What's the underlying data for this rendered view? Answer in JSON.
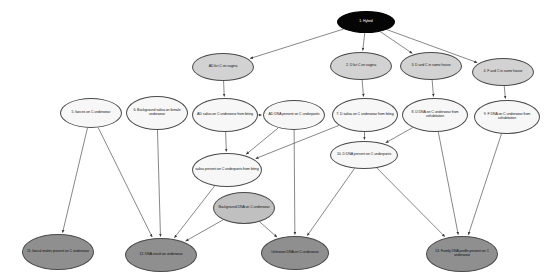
{
  "diagram": {
    "background_color": "#ffffff",
    "edge_color": "#555555",
    "nodes": [
      {
        "id": "n1",
        "label": "1. Hybrid",
        "x": 337,
        "y": 11,
        "w": 58,
        "h": 22,
        "fill": "#050505",
        "text_color": "#ffffff",
        "style": "fill-black",
        "font_size": 3.6
      },
      {
        "id": "n2",
        "label": "2. D lict C on vagina",
        "x": 330,
        "y": 52,
        "w": 62,
        "h": 28,
        "fill": "#d2d2d2",
        "text_color": "#1a1a1a",
        "style": "fill-light",
        "font_size": 3.6
      },
      {
        "id": "n3",
        "label": "3. D and C in same house",
        "x": 400,
        "y": 52,
        "w": 62,
        "h": 28,
        "fill": "#d2d2d2",
        "text_color": "#1a1a1a",
        "style": "fill-light",
        "font_size": 3.6
      },
      {
        "id": "n4",
        "label": "4. F and C in same house",
        "x": 472,
        "y": 58,
        "w": 62,
        "h": 28,
        "fill": "#d2d2d2",
        "text_color": "#1a1a1a",
        "style": "fill-light",
        "font_size": 3.6
      },
      {
        "id": "n5",
        "label": "5. faeces on C underwear",
        "x": 60,
        "y": 98,
        "w": 62,
        "h": 30,
        "fill": "#f7f7f7",
        "text_color": "#1a1a1a",
        "style": "fill-white",
        "font_size": 3.6
      },
      {
        "id": "n6",
        "label": "6. Background saliva on female underwear",
        "x": 126,
        "y": 96,
        "w": 62,
        "h": 34,
        "fill": "#f7f7f7",
        "text_color": "#1a1a1a",
        "style": "fill-white",
        "font_size": 3.6
      },
      {
        "id": "nAD1",
        "label": "AD lict C on vagina",
        "x": 192,
        "y": 53,
        "w": 62,
        "h": 28,
        "fill": "#d2d2d2",
        "text_color": "#1a1a1a",
        "style": "fill-light",
        "font_size": 3.6
      },
      {
        "id": "nAD2",
        "label": "AD saliva on C underwear from biting",
        "x": 192,
        "y": 98,
        "w": 66,
        "h": 34,
        "fill": "#f7f7f7",
        "text_color": "#1a1a1a",
        "style": "fill-white",
        "font_size": 3.6
      },
      {
        "id": "nAD3",
        "label": "AD DNA present on C underpants",
        "x": 263,
        "y": 100,
        "w": 62,
        "h": 30,
        "fill": "#f7f7f7",
        "text_color": "#1a1a1a",
        "style": "fill-white",
        "font_size": 3.6
      },
      {
        "id": "n7",
        "label": "7. D saliva on C underwear from biting",
        "x": 332,
        "y": 98,
        "w": 66,
        "h": 34,
        "fill": "#f7f7f7",
        "text_color": "#1a1a1a",
        "style": "fill-white",
        "font_size": 3.6
      },
      {
        "id": "n8",
        "label": "8. D DNA on C underwear from cohabitation",
        "x": 402,
        "y": 98,
        "w": 66,
        "h": 34,
        "fill": "#f7f7f7",
        "text_color": "#1a1a1a",
        "style": "fill-white",
        "font_size": 3.6
      },
      {
        "id": "n9",
        "label": "9. F DNA on C underwear from cohabitation",
        "x": 474,
        "y": 100,
        "w": 66,
        "h": 34,
        "fill": "#f7f7f7",
        "text_color": "#1a1a1a",
        "style": "fill-white",
        "font_size": 3.6
      },
      {
        "id": "n10",
        "label": "10. D DNA present on C underpants",
        "x": 330,
        "y": 141,
        "w": 68,
        "h": 28,
        "fill": "#f7f7f7",
        "text_color": "#1a1a1a",
        "style": "fill-white",
        "font_size": 3.6
      },
      {
        "id": "nS",
        "label": "saliva present on C underpants from biting",
        "x": 192,
        "y": 153,
        "w": 70,
        "h": 34,
        "fill": "#f7f7f7",
        "text_color": "#1a1a1a",
        "style": "fill-white",
        "font_size": 3.6
      },
      {
        "id": "nBG",
        "label": "Background DNA on C underwear",
        "x": 213,
        "y": 192,
        "w": 62,
        "h": 32,
        "fill": "#c0c0c0",
        "text_color": "#1a1a1a",
        "style": "fill-mid",
        "font_size": 3.6
      },
      {
        "id": "n11",
        "label": "11. faecal matter present on C underwear",
        "x": 22,
        "y": 234,
        "w": 72,
        "h": 36,
        "fill": "#8f8f8f",
        "text_color": "#121212",
        "style": "fill-dark",
        "font_size": 3.6
      },
      {
        "id": "n12",
        "label": "12. DNA result on underwear",
        "x": 125,
        "y": 238,
        "w": 72,
        "h": 34,
        "fill": "#8f8f8f",
        "text_color": "#121212",
        "style": "fill-dark",
        "font_size": 3.6
      },
      {
        "id": "nU",
        "label": "Unknown DNA on C underwear",
        "x": 261,
        "y": 236,
        "w": 68,
        "h": 34,
        "fill": "#8f8f8f",
        "text_color": "#121212",
        "style": "fill-dark",
        "font_size": 3.6
      },
      {
        "id": "n13",
        "label": "13. Family DNA profile present on C underwear",
        "x": 426,
        "y": 236,
        "w": 72,
        "h": 36,
        "fill": "#8f8f8f",
        "text_color": "#121212",
        "style": "fill-dark",
        "font_size": 3.6
      }
    ],
    "edges": [
      {
        "from": "n1",
        "to": "nAD1"
      },
      {
        "from": "n1",
        "to": "n2"
      },
      {
        "from": "n1",
        "to": "n3"
      },
      {
        "from": "n1",
        "to": "n4"
      },
      {
        "from": "nAD1",
        "to": "nAD2"
      },
      {
        "from": "nAD2",
        "to": "nAD3"
      },
      {
        "from": "nAD2",
        "to": "nS"
      },
      {
        "from": "nAD3",
        "to": "nS"
      },
      {
        "from": "n2",
        "to": "n7"
      },
      {
        "from": "n3",
        "to": "n8"
      },
      {
        "from": "n4",
        "to": "n9"
      },
      {
        "from": "n7",
        "to": "n10"
      },
      {
        "from": "n8",
        "to": "n10"
      },
      {
        "from": "n7",
        "to": "nS"
      },
      {
        "from": "n5",
        "to": "n11"
      },
      {
        "from": "n5",
        "to": "n12"
      },
      {
        "from": "n6",
        "to": "n12"
      },
      {
        "from": "nS",
        "to": "n12"
      },
      {
        "from": "nAD3",
        "to": "nU"
      },
      {
        "from": "nBG",
        "to": "nU"
      },
      {
        "from": "nBG",
        "to": "n12"
      },
      {
        "from": "n10",
        "to": "nU"
      },
      {
        "from": "n9",
        "to": "n13"
      },
      {
        "from": "n10",
        "to": "n13"
      },
      {
        "from": "n8",
        "to": "n13"
      }
    ]
  }
}
